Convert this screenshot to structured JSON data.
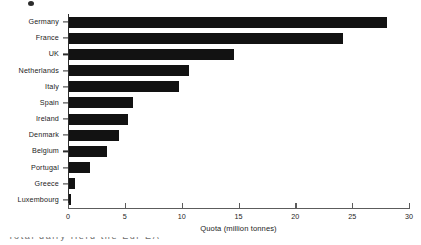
{
  "figure": {
    "marker": "figure-bullet",
    "caption_fragment": "Total dairy Herd the Eur EA"
  },
  "chart_data": {
    "type": "bar",
    "orientation": "horizontal",
    "title": "",
    "subtitle": "",
    "xlabel": "Quota (million tonnes)",
    "ylabel": "",
    "categories": [
      "Germany",
      "France",
      "UK",
      "Netherlands",
      "Italy",
      "Spain",
      "Ireland",
      "Denmark",
      "Belgium",
      "Portugal",
      "Greece",
      "Luxembourg"
    ],
    "values": [
      28.0,
      24.1,
      14.5,
      10.6,
      9.7,
      5.6,
      5.2,
      4.4,
      3.3,
      1.85,
      0.55,
      0.2
    ],
    "xlim": [
      0,
      30
    ],
    "xticks": [
      0,
      5,
      10,
      15,
      20,
      25,
      30
    ],
    "xticklabels": [
      "0",
      "5",
      "10",
      "15",
      "20",
      "25",
      "30"
    ],
    "grid": false,
    "legend": null,
    "bar_color": "#121212",
    "axis_color": "#2d2d2d"
  }
}
